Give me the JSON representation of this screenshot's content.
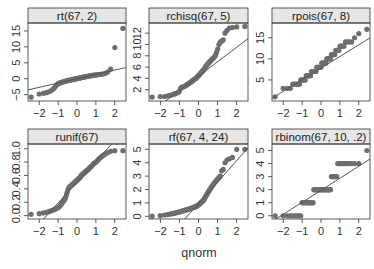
{
  "chart_data": {
    "type": "scatter",
    "subtype": "qq-plot-facets",
    "xlabel": "qnorm",
    "ylabel": "",
    "layout": {
      "rows": 2,
      "cols": 3
    },
    "x_ticks": [
      -2,
      -1,
      0,
      1,
      2
    ],
    "panels": [
      {
        "title": "rt(67, 2)",
        "xlim": [
          -2.6,
          2.6
        ],
        "ylim": [
          -7,
          17.5
        ],
        "y_ticks": [
          -5,
          0,
          5,
          10,
          15
        ],
        "y_tick_labels": [
          "-5",
          "0",
          "5",
          "10",
          "15"
        ],
        "line": {
          "intercept": 0.0,
          "slope": 1.35
        },
        "points": [
          -5.8,
          -4.8,
          -4.6,
          -4.4,
          -4.1,
          -3.8,
          -3.4,
          -3.0,
          -2.4,
          -1.9,
          -1.6,
          -1.4,
          -1.3,
          -1.2,
          -1.1,
          -1.0,
          -0.9,
          -0.85,
          -0.8,
          -0.7,
          -0.6,
          -0.55,
          -0.5,
          -0.45,
          -0.4,
          -0.35,
          -0.3,
          -0.25,
          -0.2,
          -0.15,
          -0.1,
          -0.05,
          0.0,
          0.05,
          0.1,
          0.15,
          0.2,
          0.25,
          0.3,
          0.35,
          0.4,
          0.45,
          0.5,
          0.55,
          0.6,
          0.65,
          0.7,
          0.75,
          0.8,
          0.85,
          0.9,
          0.95,
          1.0,
          1.05,
          1.1,
          1.15,
          1.2,
          1.25,
          1.3,
          1.35,
          1.4,
          1.5,
          1.7,
          2.1,
          3.0,
          9.8,
          15.8
        ]
      },
      {
        "title": "rchisq(67, 5)",
        "xlim": [
          -2.6,
          2.6
        ],
        "ylim": [
          0,
          13.8
        ],
        "y_ticks": [
          2,
          4,
          6,
          8,
          10,
          12
        ],
        "y_tick_labels": [
          "2",
          "4",
          "6",
          "8",
          "10",
          "12"
        ],
        "line": {
          "intercept": 4.4,
          "slope": 2.55
        },
        "points": [
          0.7,
          0.8,
          0.8,
          0.9,
          1.0,
          1.1,
          1.2,
          1.3,
          1.4,
          1.5,
          1.7,
          2.2,
          2.4,
          2.5,
          2.5,
          2.6,
          2.7,
          2.8,
          2.9,
          3.0,
          3.1,
          3.2,
          3.3,
          3.4,
          3.5,
          3.6,
          3.7,
          3.8,
          3.9,
          4.0,
          4.1,
          4.2,
          4.4,
          4.5,
          4.6,
          4.8,
          4.9,
          5.1,
          5.2,
          5.4,
          5.5,
          5.7,
          5.9,
          6.1,
          6.3,
          6.5,
          6.6,
          6.8,
          7.0,
          7.1,
          7.3,
          7.5,
          7.6,
          7.8,
          8.1,
          8.6,
          9.2,
          10.0,
          10.4,
          10.6,
          10.8,
          12.0,
          12.5,
          12.9,
          13.0,
          13.1,
          13.2
        ]
      },
      {
        "title": "rpois(67, 8)",
        "xlim": [
          -2.6,
          2.6
        ],
        "ylim": [
          0,
          18.5
        ],
        "y_ticks": [
          5,
          10,
          15
        ],
        "y_tick_labels": [
          "5",
          "10",
          "15"
        ],
        "line": {
          "intercept": 7.8,
          "slope": 2.75
        },
        "points": [
          1,
          3,
          3,
          3,
          4,
          4,
          4,
          4,
          4,
          5,
          5,
          5,
          5,
          5,
          6,
          6,
          6,
          6,
          6,
          6,
          7,
          7,
          7,
          7,
          7,
          7,
          7,
          8,
          8,
          8,
          8,
          8,
          8,
          8,
          9,
          9,
          9,
          9,
          9,
          9,
          9,
          10,
          10,
          10,
          10,
          10,
          10,
          11,
          11,
          11,
          11,
          11,
          12,
          12,
          12,
          12,
          13,
          13,
          13,
          13,
          14,
          14,
          14,
          14,
          15,
          16,
          17
        ]
      },
      {
        "title": "runif(67)",
        "xlim": [
          -2.6,
          2.6
        ],
        "ylim": [
          -0.05,
          1.07
        ],
        "y_ticks": [
          0.0,
          0.2,
          0.4,
          0.6,
          0.8,
          1.0
        ],
        "y_tick_labels": [
          "0.0",
          "0.2",
          "0.4",
          "0.6",
          "0.8",
          "1.0"
        ],
        "line": {
          "intercept": 0.5,
          "slope": 0.31
        },
        "points": [
          0.02,
          0.03,
          0.04,
          0.05,
          0.06,
          0.07,
          0.08,
          0.09,
          0.1,
          0.11,
          0.12,
          0.13,
          0.15,
          0.17,
          0.19,
          0.21,
          0.23,
          0.25,
          0.28,
          0.32,
          0.36,
          0.4,
          0.42,
          0.43,
          0.44,
          0.45,
          0.46,
          0.47,
          0.48,
          0.49,
          0.5,
          0.51,
          0.52,
          0.53,
          0.54,
          0.55,
          0.56,
          0.57,
          0.58,
          0.6,
          0.61,
          0.62,
          0.63,
          0.64,
          0.65,
          0.66,
          0.67,
          0.68,
          0.69,
          0.7,
          0.72,
          0.73,
          0.74,
          0.76,
          0.78,
          0.79,
          0.8,
          0.82,
          0.84,
          0.86,
          0.88,
          0.9,
          0.92,
          0.94,
          0.96,
          0.97,
          0.97
        ]
      },
      {
        "title": "rf(67, 4, 24)",
        "xlim": [
          -2.6,
          2.6
        ],
        "ylim": [
          -0.2,
          5.4
        ],
        "y_ticks": [
          0,
          1,
          2,
          3,
          4,
          5
        ],
        "y_tick_labels": [
          "0",
          "1",
          "2",
          "3",
          "4",
          "5"
        ],
        "line": {
          "intercept": 0.95,
          "slope": 1.6
        },
        "points": [
          0.02,
          0.05,
          0.1,
          0.13,
          0.16,
          0.2,
          0.22,
          0.25,
          0.28,
          0.3,
          0.33,
          0.36,
          0.38,
          0.4,
          0.42,
          0.44,
          0.46,
          0.48,
          0.5,
          0.52,
          0.54,
          0.56,
          0.58,
          0.6,
          0.62,
          0.64,
          0.66,
          0.68,
          0.7,
          0.72,
          0.75,
          0.78,
          0.82,
          0.86,
          0.9,
          0.95,
          1.0,
          1.05,
          1.1,
          1.15,
          1.2,
          1.3,
          1.4,
          1.5,
          1.6,
          1.7,
          1.8,
          1.9,
          2.0,
          2.1,
          2.2,
          2.3,
          2.4,
          2.5,
          2.6,
          2.7,
          2.8,
          2.9,
          3.0,
          3.4,
          3.5,
          4.0,
          4.2,
          4.3,
          4.4,
          5.0,
          5.0
        ]
      },
      {
        "title": "rbinom(67, 10, .2)",
        "xlim": [
          -2.6,
          2.6
        ],
        "ylim": [
          -0.25,
          5.5
        ],
        "y_ticks": [
          0,
          1,
          2,
          3,
          4,
          5
        ],
        "y_tick_labels": [
          "0",
          "1",
          "2",
          "3",
          "4",
          "5"
        ],
        "line": {
          "intercept": 1.95,
          "slope": 0.92
        },
        "points": [
          0,
          0,
          0,
          0,
          0,
          0,
          0,
          0,
          0,
          0,
          1,
          1,
          1,
          1,
          1,
          1,
          1,
          1,
          1,
          1,
          1,
          1,
          1,
          2,
          2,
          2,
          2,
          2,
          2,
          2,
          2,
          2,
          2,
          2,
          2,
          2,
          2,
          2,
          2,
          2,
          2,
          2,
          2,
          2,
          2,
          2,
          2,
          3,
          3,
          3,
          3,
          3,
          3,
          3,
          4,
          4,
          4,
          4,
          4,
          4,
          4,
          4,
          4,
          4,
          4,
          4,
          5
        ]
      }
    ]
  }
}
